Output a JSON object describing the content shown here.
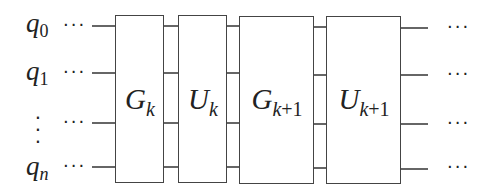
{
  "diagram": {
    "type": "quantum-circuit",
    "qubits": [
      {
        "label": "q",
        "sub": "0"
      },
      {
        "label": "q",
        "sub": "1"
      },
      {
        "label": "⋮",
        "sub": ""
      },
      {
        "label": "q",
        "sub": "n"
      }
    ],
    "gates": [
      {
        "base": "G",
        "sub_var": "k",
        "sub_rest": ""
      },
      {
        "base": "U",
        "sub_var": "k",
        "sub_rest": ""
      },
      {
        "base": "G",
        "sub_var": "k",
        "sub_rest": "+1"
      },
      {
        "base": "U",
        "sub_var": "k",
        "sub_rest": "+1"
      }
    ],
    "ellipsis": "···",
    "colors": {
      "line": "#333333",
      "box_fill": "#ffffff",
      "text": "#222222"
    }
  }
}
